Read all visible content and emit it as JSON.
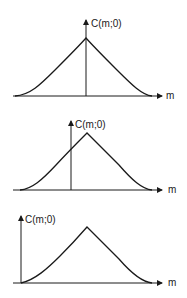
{
  "figure": {
    "panels": [
      {
        "id": "panel-1",
        "y_axis_label": "C(m;0)",
        "x_axis_label": "m",
        "description": "Symmetric peak with vertical axis through the peak"
      },
      {
        "id": "panel-2",
        "y_axis_label": "C(m;0)",
        "x_axis_label": "m",
        "description": "Same peak with vertical axis shifted left of the peak"
      },
      {
        "id": "panel-3",
        "y_axis_label": "C(m;0)",
        "x_axis_label": "m",
        "description": "Same peak with vertical axis at the left edge of the curve"
      }
    ],
    "caption_cutoff": ""
  },
  "colors": {
    "ink": "#1a1a1a",
    "background": "#ffffff"
  }
}
